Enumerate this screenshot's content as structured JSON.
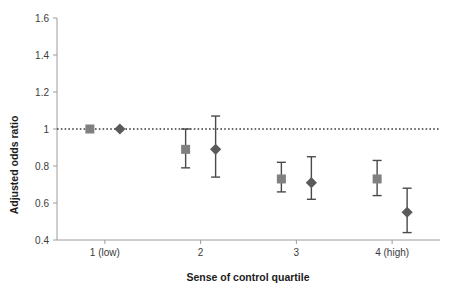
{
  "chart_data": {
    "type": "scatter",
    "title": "",
    "xlabel": "Sense of control quartile",
    "ylabel": "Adjusted odds ratio",
    "categories": [
      "1 (low)",
      "2",
      "3",
      "4 (high)"
    ],
    "ylim": [
      0.4,
      1.6
    ],
    "yticks": [
      0.4,
      0.6,
      0.8,
      1.0,
      1.2,
      1.4,
      1.6
    ],
    "ytick_labels": [
      "0.4",
      "0.6",
      "0.8",
      "1",
      "1.2",
      "1.4",
      "1.6"
    ],
    "grid": false,
    "legend": "none",
    "reference_line": {
      "value": 1.0,
      "style": "dotted",
      "color": "#3b3b3b"
    },
    "series": [
      {
        "name": "model-1-square",
        "marker": "square",
        "color": "#808080",
        "points": [
          {
            "category": "1 (low)",
            "value": 1.0,
            "ci_low": null,
            "ci_high": null,
            "reference": true
          },
          {
            "category": "2",
            "value": 0.89,
            "ci_low": 0.79,
            "ci_high": 1.0,
            "reference": false
          },
          {
            "category": "3",
            "value": 0.73,
            "ci_low": 0.66,
            "ci_high": 0.82,
            "reference": false
          },
          {
            "category": "4 (high)",
            "value": 0.73,
            "ci_low": 0.64,
            "ci_high": 0.83,
            "reference": false
          }
        ]
      },
      {
        "name": "model-2-diamond",
        "marker": "diamond",
        "color": "#5a5a5a",
        "points": [
          {
            "category": "1 (low)",
            "value": 1.0,
            "ci_low": null,
            "ci_high": null,
            "reference": true
          },
          {
            "category": "2",
            "value": 0.89,
            "ci_low": 0.74,
            "ci_high": 1.07,
            "reference": false
          },
          {
            "category": "3",
            "value": 0.71,
            "ci_low": 0.62,
            "ci_high": 0.85,
            "reference": false
          },
          {
            "category": "4 (high)",
            "value": 0.55,
            "ci_low": 0.44,
            "ci_high": 0.68,
            "reference": false
          }
        ]
      }
    ],
    "colors": {
      "axis": "#9c9c9c",
      "text": "#3b3b3b",
      "title_text": "#1c1c1c",
      "square_marker": "#808080",
      "diamond_marker": "#5a5a5a",
      "error_bar": "#4a4a4a",
      "background": "#ffffff"
    }
  }
}
